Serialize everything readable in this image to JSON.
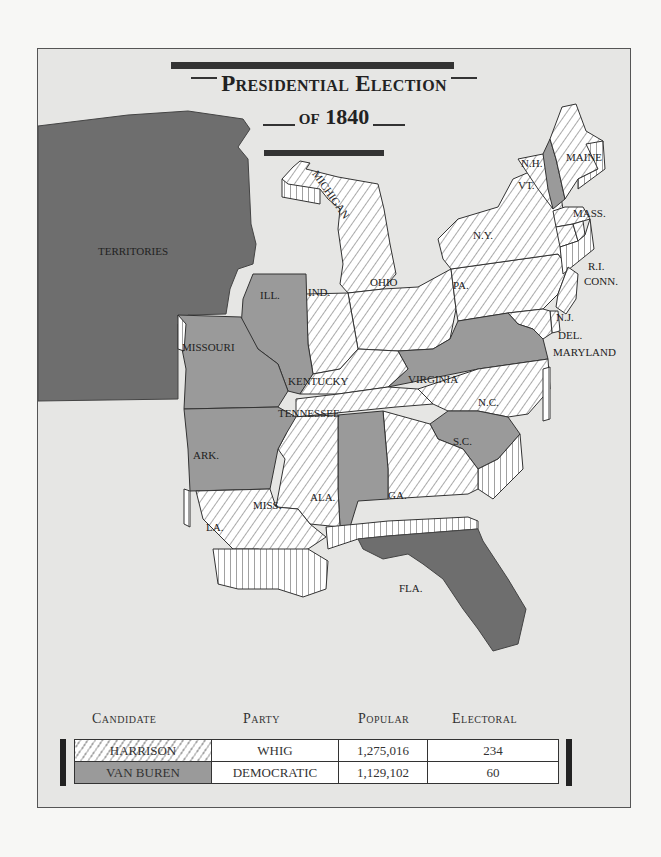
{
  "title": {
    "line1": "Presidential Election",
    "line2": "of 1840"
  },
  "legend": {
    "harrison_fill": "hatched",
    "vanburen_fill": "#9a9a9a",
    "territory_fill": "#6e6e6e"
  },
  "map": {
    "labels": {
      "territories": "TERRITORIES",
      "michigan": "MICHIGAN",
      "maine": "MAINE",
      "nh": "N.H.",
      "vt": "VT.",
      "ny": "N.Y.",
      "mass": "MASS.",
      "ri": "R.I.",
      "conn": "CONN.",
      "pa": "PA.",
      "nj": "N.J.",
      "del": "DEL.",
      "maryland": "MARYLAND",
      "ohio": "OHIO",
      "ind": "IND.",
      "ill": "ILL.",
      "missouri": "MISSOURI",
      "kentucky": "KENTUCKY",
      "virginia": "VIRGINIA",
      "nc": "N.C.",
      "tennessee": "TENNESSEE",
      "sc": "S.C.",
      "ark": "ARK.",
      "miss": "MISS.",
      "ala": "ALA.",
      "ga": "GA.",
      "la": "LA.",
      "fla": "FLA."
    },
    "states_harrison": [
      "Maine",
      "Vermont",
      "New York",
      "Massachusetts",
      "Rhode Island",
      "Connecticut",
      "Pennsylvania",
      "New Jersey",
      "Delaware",
      "Maryland",
      "Ohio",
      "Indiana",
      "Michigan",
      "Kentucky",
      "North Carolina",
      "Tennessee",
      "Mississippi",
      "Georgia",
      "Louisiana"
    ],
    "states_vanburen": [
      "New Hampshire",
      "Virginia",
      "Illinois",
      "Missouri",
      "Arkansas",
      "Alabama",
      "South Carolina"
    ],
    "non_states": [
      "Territories",
      "Florida"
    ]
  },
  "table": {
    "headers": [
      "Candidate",
      "Party",
      "Popular",
      "Electoral"
    ],
    "rows": [
      {
        "candidate": "HARRISON",
        "party": "WHIG",
        "popular": "1,275,016",
        "electoral": "234"
      },
      {
        "candidate": "VAN BUREN",
        "party": "DEMOCRATIC",
        "popular": "1,129,102",
        "electoral": "60"
      }
    ]
  }
}
